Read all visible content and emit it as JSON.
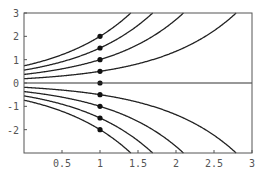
{
  "chart_data": {
    "type": "line",
    "title": "",
    "xlabel": "",
    "ylabel": "",
    "xlim": [
      0,
      3
    ],
    "ylim": [
      -3,
      3
    ],
    "grid": false,
    "legend": null,
    "x_ticks": [
      0.5,
      1,
      1.5,
      2,
      2.5,
      3
    ],
    "x_tick_labels": [
      "0.5",
      "1",
      "1.5",
      "2",
      "2.5",
      "3"
    ],
    "y_ticks": [
      -2,
      -1,
      0,
      1,
      2,
      3
    ],
    "y_tick_labels": [
      "-2",
      "-1",
      "0",
      "1",
      "2",
      "3"
    ],
    "model": "y = y0 * exp(x - 1)",
    "initial_points": [
      {
        "x": 1,
        "y": 2
      },
      {
        "x": 1,
        "y": 1.5
      },
      {
        "x": 1,
        "y": 1
      },
      {
        "x": 1,
        "y": 0.5
      },
      {
        "x": 1,
        "y": 0
      },
      {
        "x": 1,
        "y": -0.5
      },
      {
        "x": 1,
        "y": -1
      },
      {
        "x": 1,
        "y": -1.5
      },
      {
        "x": 1,
        "y": -2
      }
    ],
    "series": [
      {
        "name": "y0=2",
        "x": [
          0,
          0.5,
          1,
          1.2,
          1.405
        ],
        "values": [
          0.74,
          1.21,
          2,
          2.44,
          3
        ]
      },
      {
        "name": "y0=1.5",
        "x": [
          0,
          0.5,
          1,
          1.5,
          1.693
        ],
        "values": [
          0.55,
          0.91,
          1.5,
          2.47,
          3
        ]
      },
      {
        "name": "y0=1",
        "x": [
          0,
          0.5,
          1,
          1.5,
          2,
          2.099
        ],
        "values": [
          0.37,
          0.61,
          1,
          1.65,
          2.72,
          3
        ]
      },
      {
        "name": "y0=0.5",
        "x": [
          0,
          0.5,
          1,
          1.5,
          2,
          2.5,
          2.792
        ],
        "values": [
          0.18,
          0.3,
          0.5,
          0.82,
          1.36,
          2.24,
          3
        ]
      },
      {
        "name": "y0=0",
        "x": [
          0,
          3
        ],
        "values": [
          0,
          0
        ]
      },
      {
        "name": "y0=-0.5",
        "x": [
          0,
          0.5,
          1,
          1.5,
          2,
          2.5,
          2.792
        ],
        "values": [
          -0.18,
          -0.3,
          -0.5,
          -0.82,
          -1.36,
          -2.24,
          -3
        ]
      },
      {
        "name": "y0=-1",
        "x": [
          0,
          0.5,
          1,
          1.5,
          2,
          2.099
        ],
        "values": [
          -0.37,
          -0.61,
          -1,
          -1.65,
          -2.72,
          -3
        ]
      },
      {
        "name": "y0=-1.5",
        "x": [
          0,
          0.5,
          1,
          1.5,
          1.693
        ],
        "values": [
          -0.55,
          -0.91,
          -1.5,
          -2.47,
          -3
        ]
      },
      {
        "name": "y0=-2",
        "x": [
          0,
          0.5,
          1,
          1.2,
          1.405
        ],
        "values": [
          -0.74,
          -1.21,
          -2,
          -2.44,
          -3
        ]
      }
    ],
    "y0_values": [
      2,
      1.5,
      1,
      0.5,
      0,
      -0.5,
      -1,
      -1.5,
      -2
    ]
  }
}
